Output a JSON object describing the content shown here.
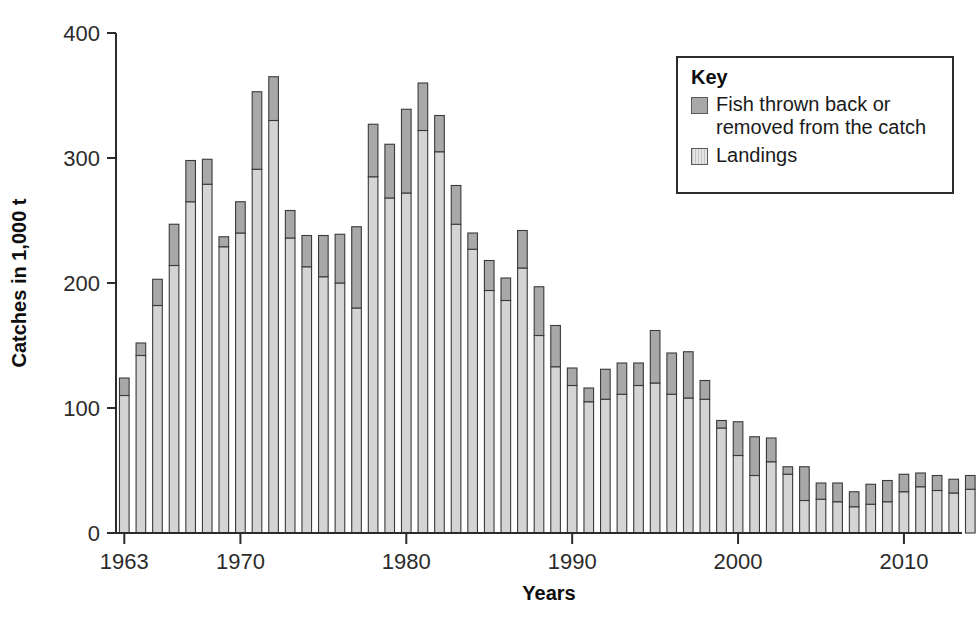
{
  "chart_data": {
    "type": "bar",
    "stacked": true,
    "title": "",
    "xlabel": "Years",
    "ylabel": "Catches in 1,000 t",
    "ylim": [
      0,
      400
    ],
    "yticks": [
      0,
      100,
      200,
      300,
      400
    ],
    "xticks": [
      1963,
      1970,
      1980,
      1990,
      2000,
      2010
    ],
    "xlim": [
      1962.5,
      2013.5
    ],
    "grid": false,
    "legend_position": "top-right",
    "legend_title": "Key",
    "series": [
      {
        "name": "Landings",
        "color": "#d4d4d4",
        "values": [
          110,
          142,
          182,
          214,
          265,
          279,
          229,
          240,
          291,
          330,
          236,
          213,
          205,
          200,
          180,
          285,
          268,
          272,
          322,
          305,
          247,
          227,
          194,
          186,
          212,
          158,
          133,
          118,
          105,
          107,
          111,
          118,
          120,
          111,
          108,
          107,
          84,
          62,
          46,
          57,
          47,
          26,
          27,
          25,
          21,
          23,
          25,
          33,
          37,
          34,
          32,
          35
        ]
      },
      {
        "name": "Fish thrown back or removed from the catch",
        "color": "#a8a8a8",
        "values": [
          14,
          10,
          21,
          33,
          33,
          20,
          8,
          25,
          62,
          35,
          22,
          25,
          33,
          39,
          65,
          42,
          43,
          67,
          38,
          29,
          31,
          13,
          24,
          18,
          30,
          39,
          33,
          14,
          11,
          24,
          25,
          18,
          42,
          33,
          37,
          15,
          6,
          27,
          31,
          19,
          6,
          27,
          13,
          15,
          12,
          16,
          17,
          14,
          11,
          12,
          11,
          11
        ]
      }
    ],
    "categories": [
      1963,
      1964,
      1965,
      1966,
      1967,
      1968,
      1969,
      1970,
      1971,
      1972,
      1973,
      1974,
      1975,
      1976,
      1977,
      1978,
      1979,
      1980,
      1981,
      1982,
      1983,
      1984,
      1985,
      1986,
      1987,
      1988,
      1989,
      1990,
      1991,
      1992,
      1993,
      1994,
      1995,
      1996,
      1997,
      1998,
      1999,
      2000,
      2001,
      2002,
      2003,
      2004,
      2005,
      2006,
      2007,
      2008,
      2009,
      2010,
      2011,
      2012,
      2013,
      2014
    ],
    "totals": [
      124,
      152,
      203,
      247,
      298,
      299,
      237,
      265,
      353,
      365,
      258,
      238,
      238,
      239,
      245,
      327,
      311,
      339,
      360,
      334,
      278,
      240,
      218,
      204,
      242,
      197,
      166,
      132,
      116,
      131,
      136,
      136,
      162,
      144,
      145,
      122,
      90,
      89,
      77,
      76,
      53,
      53,
      40,
      40,
      33,
      39,
      42,
      47,
      48,
      46,
      43,
      46
    ]
  },
  "legend": {
    "title": "Key",
    "items": [
      {
        "label_line1": "Fish thrown back or",
        "label_line2": "removed from the catch",
        "swatch": "discard-swatch"
      },
      {
        "label_line1": "Landings",
        "label_line2": "",
        "swatch": "landings-swatch"
      }
    ]
  },
  "axes": {
    "y_title": "Catches in 1,000 t",
    "x_title": "Years",
    "y_tick_labels": [
      "0",
      "100",
      "200",
      "300",
      "400"
    ],
    "x_tick_labels": [
      "1963",
      "1970",
      "1980",
      "1990",
      "2000",
      "2010"
    ]
  },
  "colors": {
    "landings": "#d4d4d4",
    "discards": "#a8a8a8",
    "axis": "#2b2b2b",
    "outline": "#3a3a3a",
    "background": "#ffffff"
  }
}
